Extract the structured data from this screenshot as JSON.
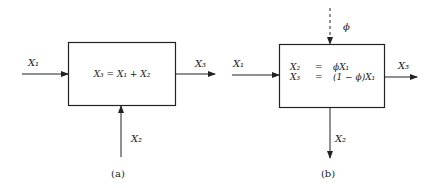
{
  "panels": [
    {
      "id": "a",
      "caption": "(a)",
      "box_equation": "X₃ = X₁ + X₂",
      "inputs": [
        {
          "label": "X₁",
          "direction": "left"
        },
        {
          "label": "X₂",
          "direction": "bottom"
        }
      ],
      "outputs": [
        {
          "label": "X₃",
          "direction": "right"
        }
      ]
    },
    {
      "id": "b",
      "caption": "(b)",
      "box_equations": [
        {
          "lhs": "X₂",
          "op": "=",
          "rhs": "ϕX₁"
        },
        {
          "lhs": "X₃",
          "op": "=",
          "rhs": "(1 − ϕ)X₁"
        }
      ],
      "control_input": {
        "label": "ϕ",
        "style": "dashed",
        "direction": "top"
      },
      "inputs": [
        {
          "label": "X₁",
          "direction": "left"
        }
      ],
      "outputs": [
        {
          "label": "X₃",
          "direction": "right"
        },
        {
          "label": "X₂",
          "direction": "bottom"
        }
      ]
    }
  ]
}
